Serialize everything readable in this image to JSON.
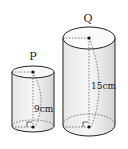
{
  "diagram": {
    "type": "two cylinders",
    "cylinders": [
      {
        "name": "P",
        "height_label": "9cm"
      },
      {
        "name": "Q",
        "height_label": "15cm"
      }
    ],
    "colors": {
      "stroke": "#222222",
      "shade": "#d9d9d9",
      "fill": "#f2f2f2"
    }
  }
}
